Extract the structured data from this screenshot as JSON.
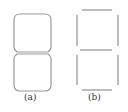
{
  "figures": [
    {
      "id": "a",
      "label": "(a)",
      "description": "outline of seven-segment digit with rounded corners"
    },
    {
      "id": "b",
      "label": "(b)",
      "description": "seven separate line segments forming digit 8"
    }
  ],
  "colors": {
    "stroke": "#9a9a9a",
    "background": "#ffffff",
    "text": "#333333"
  }
}
